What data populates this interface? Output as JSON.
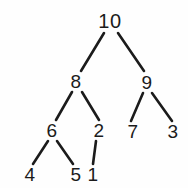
{
  "diagram": {
    "background_color": "#fefefe",
    "stroke_color": "#1b1b1b",
    "text_color": "#1b1b1b",
    "width": 188,
    "height": 188
  },
  "nodes": [
    {
      "id": "n10",
      "label": "10",
      "x": 110,
      "y": 21,
      "level": 0
    },
    {
      "id": "n8",
      "label": "8",
      "x": 76,
      "y": 81,
      "level": 1
    },
    {
      "id": "n9",
      "label": "9",
      "x": 147,
      "y": 82,
      "level": 1
    },
    {
      "id": "n6",
      "label": "6",
      "x": 52,
      "y": 130,
      "level": 2
    },
    {
      "id": "n2",
      "label": "2",
      "x": 99,
      "y": 130,
      "level": 2
    },
    {
      "id": "n7",
      "label": "7",
      "x": 133,
      "y": 131,
      "level": 2
    },
    {
      "id": "n3",
      "label": "3",
      "x": 173,
      "y": 131,
      "level": 2
    },
    {
      "id": "n4",
      "label": "4",
      "x": 30,
      "y": 174,
      "level": 3
    },
    {
      "id": "n5",
      "label": "5",
      "x": 76,
      "y": 174,
      "level": 3
    },
    {
      "id": "n1",
      "label": "1",
      "x": 93,
      "y": 174,
      "level": 3
    }
  ],
  "edges": [
    {
      "id": "e-10-8",
      "from": "n10",
      "to": "n8",
      "x1": 104,
      "y1": 33,
      "x2": 81,
      "y2": 71
    },
    {
      "id": "e-10-9",
      "from": "n10",
      "to": "n9",
      "x1": 118,
      "y1": 33,
      "x2": 144,
      "y2": 71
    },
    {
      "id": "e-8-6",
      "from": "n8",
      "to": "n6",
      "x1": 72,
      "y1": 92,
      "x2": 56,
      "y2": 120
    },
    {
      "id": "e-8-2",
      "from": "n8",
      "to": "n2",
      "x1": 82,
      "y1": 92,
      "x2": 99,
      "y2": 120
    },
    {
      "id": "e-9-7",
      "from": "n9",
      "to": "n7",
      "x1": 143,
      "y1": 93,
      "x2": 131,
      "y2": 121
    },
    {
      "id": "e-9-3",
      "from": "n9",
      "to": "n3",
      "x1": 152,
      "y1": 93,
      "x2": 172,
      "y2": 121
    },
    {
      "id": "e-6-4",
      "from": "n6",
      "to": "n4",
      "x1": 48,
      "y1": 141,
      "x2": 33,
      "y2": 164
    },
    {
      "id": "e-6-5",
      "from": "n6",
      "to": "n5",
      "x1": 57,
      "y1": 141,
      "x2": 73,
      "y2": 164
    },
    {
      "id": "e-2-1",
      "from": "n2",
      "to": "n1",
      "x1": 96,
      "y1": 141,
      "x2": 93,
      "y2": 164
    }
  ],
  "structure": {
    "type": "binary-tree",
    "root": "10",
    "adjacency": {
      "10": [
        "8",
        "9"
      ],
      "8": [
        "6",
        "2"
      ],
      "9": [
        "7",
        "3"
      ],
      "6": [
        "4",
        "5"
      ],
      "2": [
        "1"
      ],
      "7": [],
      "3": [],
      "4": [],
      "5": [],
      "1": []
    }
  }
}
